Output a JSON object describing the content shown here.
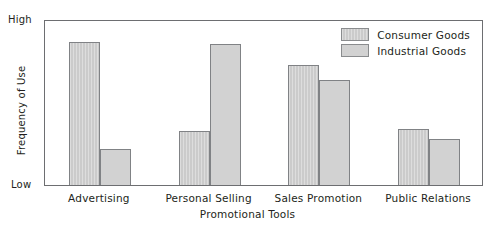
{
  "chart_data": {
    "type": "bar",
    "title": "",
    "xlabel": "Promotional Tools",
    "ylabel": "Frequency of Use",
    "categories": [
      "Advertising",
      "Personal Selling",
      "Sales Promotion",
      "Public Relations"
    ],
    "series": [
      {
        "name": "Consumer Goods",
        "values": [
          87,
          33,
          73,
          34
        ],
        "color": "#cbcbcb"
      },
      {
        "name": "Industrial Goods",
        "values": [
          22,
          86,
          64,
          28
        ],
        "color": "#d2d2d2"
      }
    ],
    "ylim": [
      0,
      100
    ],
    "y_axis_low_label": "Low",
    "y_axis_high_label": "High",
    "grid": false,
    "legend_position": "top-right",
    "axis_color": "#6d6e71"
  }
}
